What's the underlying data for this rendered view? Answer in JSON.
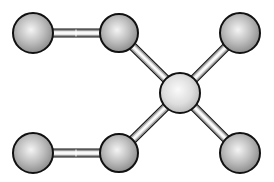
{
  "diagram": {
    "type": "ball-and-stick-molecule",
    "colors": {
      "background": "#ffffff",
      "outline": "#111111",
      "atom_dark": "#8a8a8a",
      "atom_mid": "#bdbdbd",
      "atom_highlight": "#f4f4f4",
      "center_atom_dark": "#b8b8b8",
      "center_atom_highlight": "#fafafa",
      "bond_fill": "#e6e6e6",
      "bond_shade": "#9a9a9a"
    },
    "atoms": [
      {
        "id": "a1",
        "label": "terminal-top-left",
        "x": 33,
        "y": 33,
        "r": 20,
        "variant": "dark"
      },
      {
        "id": "a2",
        "label": "top-middle",
        "x": 119,
        "y": 33,
        "r": 19,
        "variant": "dark"
      },
      {
        "id": "a3",
        "label": "top-right",
        "x": 240,
        "y": 33,
        "r": 20,
        "variant": "dark"
      },
      {
        "id": "a4",
        "label": "center",
        "x": 180,
        "y": 93,
        "r": 20,
        "variant": "light"
      },
      {
        "id": "a5",
        "label": "terminal-bottom-left",
        "x": 33,
        "y": 153,
        "r": 20,
        "variant": "dark"
      },
      {
        "id": "a6",
        "label": "bottom-middle",
        "x": 119,
        "y": 153,
        "r": 19,
        "variant": "dark"
      },
      {
        "id": "a7",
        "label": "bottom-right",
        "x": 240,
        "y": 153,
        "r": 20,
        "variant": "dark"
      }
    ],
    "bonds": [
      {
        "from": "a1",
        "to": "a2",
        "style": "double-tone"
      },
      {
        "from": "a2",
        "to": "a4",
        "style": "single"
      },
      {
        "from": "a3",
        "to": "a4",
        "style": "single"
      },
      {
        "from": "a5",
        "to": "a6",
        "style": "double-tone"
      },
      {
        "from": "a6",
        "to": "a4",
        "style": "single"
      },
      {
        "from": "a7",
        "to": "a4",
        "style": "single"
      }
    ]
  }
}
